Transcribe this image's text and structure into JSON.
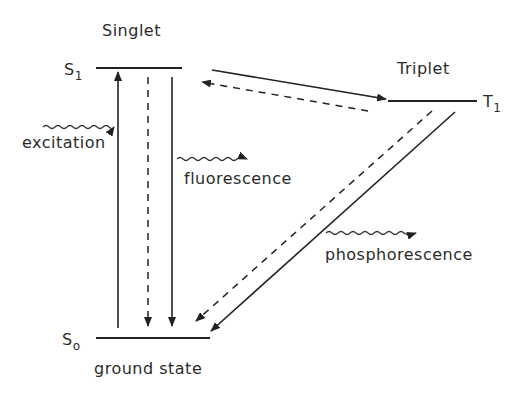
{
  "diagram": {
    "labels": {
      "singlet": "Singlet",
      "triplet": "Triplet",
      "s1_main": "S",
      "s1_sub": "1",
      "t1_main": "T",
      "t1_sub": "1",
      "s0_main": "S",
      "s0_sub": "o",
      "ground_state": "ground state",
      "excitation": "excitation",
      "fluorescence": "fluorescence",
      "phosphorescence": "phosphorescence"
    },
    "levels": [
      {
        "id": "S1",
        "label": "S1",
        "group": "Singlet"
      },
      {
        "id": "T1",
        "label": "T1",
        "group": "Triplet"
      },
      {
        "id": "S0",
        "label": "S0",
        "group": "ground state"
      }
    ],
    "transitions": [
      {
        "from": "S0",
        "to": "S1",
        "style": "solid",
        "name": "excitation"
      },
      {
        "from": "S1",
        "to": "S0",
        "style": "dashed",
        "name": "non-radiative decay"
      },
      {
        "from": "S1",
        "to": "S0",
        "style": "solid",
        "name": "fluorescence"
      },
      {
        "from": "S1",
        "to": "T1",
        "style": "solid",
        "name": "intersystem crossing"
      },
      {
        "from": "T1",
        "to": "S1",
        "style": "dashed",
        "name": "reverse intersystem crossing"
      },
      {
        "from": "T1",
        "to": "S0",
        "style": "dashed",
        "name": "non-radiative decay"
      },
      {
        "from": "T1",
        "to": "S0",
        "style": "solid",
        "name": "phosphorescence"
      }
    ],
    "colors": {
      "ink": "#222222",
      "background": "#ffffff"
    }
  }
}
